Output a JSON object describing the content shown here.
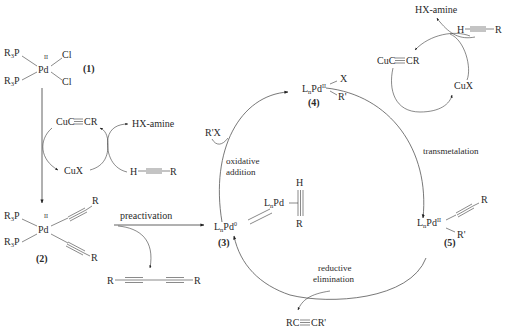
{
  "diagram": {
    "type": "catalytic-cycle",
    "compounds": {
      "c1": {
        "number": "(1)",
        "center": "Pd",
        "oxidation": "II",
        "ligands": [
          "R3P",
          "R3P",
          "Cl",
          "Cl"
        ]
      },
      "c2": {
        "number": "(2)",
        "center": "Pd",
        "oxidation": "II",
        "ligands": [
          "R3P",
          "R3P",
          "C≡C–R",
          "C≡C–R"
        ]
      },
      "c3": {
        "number": "(3)",
        "label_main": "L",
        "label_sub": "n",
        "label_pd": "Pd",
        "label_sup": "0"
      },
      "c4": {
        "number": "(4)",
        "label_main": "L",
        "label_sub": "n",
        "label_pd": "Pd",
        "label_sup": "II",
        "ligand_x": "X",
        "ligand_r": "R'"
      },
      "c5": {
        "number": "(5)",
        "label_main": "L",
        "label_sub": "n",
        "label_pd": "Pd",
        "label_sup": "II",
        "ligand_alkyne_r": "R",
        "ligand_r": "R'"
      },
      "pi_complex": {
        "label_main": "L",
        "label_sub": "n",
        "label_pd": "Pd",
        "top": "H",
        "bottom": "R"
      }
    },
    "left_copper_cycle": {
      "cu_acetylide": "CuC≡CR",
      "cu_x": "CuX",
      "hx_amine": "HX-amine",
      "alkyne_h": "H",
      "alkyne_r": "R"
    },
    "right_copper_cycle": {
      "cu_acetylide": "CuC≡CR",
      "cu_x": "CuX",
      "hx_amine": "HX-amine",
      "alkyne_h": "H",
      "alkyne_r": "R"
    },
    "steps": {
      "preactivation": "preactivation",
      "oxidative_addition_1": "oxidative",
      "oxidative_addition_2": "addition",
      "transmetalation": "transmetalation",
      "reductive_elimination_1": "reductive",
      "reductive_elimination_2": "elimination"
    },
    "reagents": {
      "aryl_halide": "R'X",
      "product": "RC≡CR'",
      "diyne_left_r": "R",
      "diyne_right_r": "R"
    }
  }
}
